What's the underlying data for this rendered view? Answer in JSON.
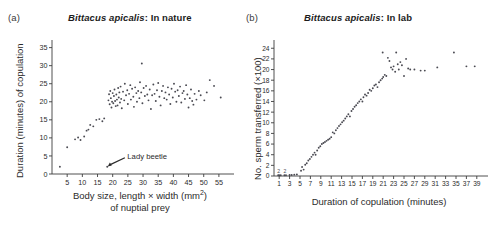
{
  "figure": {
    "background": "#ffffff",
    "point_color": "#4a4a52",
    "axis_color": "#3c3c3c"
  },
  "panels": [
    {
      "key": "a",
      "label": "(a)",
      "title_species": "Bittacus apicalis",
      "title_rest": ": In nature",
      "annotation": "Lady beetle",
      "chart_data": {
        "type": "scatter",
        "title": "Bittacus apicalis: In nature",
        "xlabel": "Body size, length × width (mm2) of nuptial prey",
        "ylabel": "Duration (minutes) of copulation",
        "xlim": [
          0,
          58
        ],
        "ylim": [
          0,
          36
        ],
        "xticks": [
          5,
          10,
          15,
          20,
          25,
          30,
          35,
          40,
          45,
          50,
          55
        ],
        "yticks": [
          0,
          5,
          10,
          15,
          20,
          25,
          30,
          35
        ],
        "grid": false,
        "legend": "none",
        "annotations": [
          {
            "text": "Lady beetle",
            "x": 18.2,
            "y": 2.0,
            "label_x": 24.5,
            "label_y": 5.2
          }
        ],
        "points": [
          [
            2.6,
            2.0
          ],
          [
            5.0,
            7.4
          ],
          [
            7.6,
            9.6
          ],
          [
            8.6,
            10.1
          ],
          [
            9.4,
            9.4
          ],
          [
            10.6,
            10.4
          ],
          [
            11.4,
            12.0
          ],
          [
            12.0,
            12.3
          ],
          [
            12.6,
            13.6
          ],
          [
            13.6,
            13.2
          ],
          [
            14.6,
            15.0
          ],
          [
            15.6,
            15.2
          ],
          [
            16.6,
            14.6
          ],
          [
            17.2,
            15.4
          ],
          [
            18.2,
            2.0
          ],
          [
            18.6,
            20.4
          ],
          [
            18.8,
            22.1
          ],
          [
            19.0,
            19.3
          ],
          [
            19.2,
            23.0
          ],
          [
            19.4,
            21.0
          ],
          [
            19.6,
            18.4
          ],
          [
            19.8,
            20.0
          ],
          [
            20.0,
            22.4
          ],
          [
            20.2,
            19.6
          ],
          [
            20.4,
            21.6
          ],
          [
            20.6,
            23.4
          ],
          [
            20.8,
            20.2
          ],
          [
            21.0,
            18.8
          ],
          [
            21.2,
            22.0
          ],
          [
            21.4,
            20.6
          ],
          [
            21.6,
            19.0
          ],
          [
            21.8,
            23.8
          ],
          [
            22.0,
            21.2
          ],
          [
            22.2,
            22.6
          ],
          [
            22.4,
            19.8
          ],
          [
            22.6,
            24.2
          ],
          [
            22.8,
            20.8
          ],
          [
            23.0,
            18.2
          ],
          [
            23.4,
            22.8
          ],
          [
            23.8,
            20.4
          ],
          [
            24.0,
            25.0
          ],
          [
            24.4,
            21.8
          ],
          [
            24.8,
            23.2
          ],
          [
            25.0,
            19.4
          ],
          [
            25.4,
            22.2
          ],
          [
            25.8,
            24.6
          ],
          [
            26.0,
            20.6
          ],
          [
            26.4,
            23.6
          ],
          [
            26.8,
            21.4
          ],
          [
            27.0,
            18.6
          ],
          [
            27.4,
            24.0
          ],
          [
            27.8,
            22.4
          ],
          [
            28.0,
            20.0
          ],
          [
            28.4,
            23.0
          ],
          [
            28.8,
            21.0
          ],
          [
            29.0,
            25.4
          ],
          [
            29.4,
            22.6
          ],
          [
            29.6,
            30.6
          ],
          [
            29.8,
            19.6
          ],
          [
            30.2,
            23.8
          ],
          [
            30.6,
            21.6
          ],
          [
            31.0,
            24.4
          ],
          [
            31.4,
            22.0
          ],
          [
            31.8,
            20.4
          ],
          [
            32.2,
            23.4
          ],
          [
            32.6,
            18.0
          ],
          [
            33.0,
            21.8
          ],
          [
            33.4,
            24.8
          ],
          [
            33.8,
            22.2
          ],
          [
            34.2,
            20.2
          ],
          [
            34.6,
            23.2
          ],
          [
            35.0,
            25.2
          ],
          [
            35.4,
            21.4
          ],
          [
            35.8,
            19.0
          ],
          [
            36.2,
            23.0
          ],
          [
            36.6,
            24.4
          ],
          [
            37.0,
            21.0
          ],
          [
            37.4,
            22.6
          ],
          [
            37.8,
            20.6
          ],
          [
            38.2,
            24.0
          ],
          [
            38.6,
            22.0
          ],
          [
            39.0,
            19.4
          ],
          [
            39.4,
            23.6
          ],
          [
            39.8,
            21.2
          ],
          [
            40.2,
            25.0
          ],
          [
            40.6,
            22.8
          ],
          [
            41.0,
            20.0
          ],
          [
            41.4,
            23.2
          ],
          [
            41.8,
            21.6
          ],
          [
            42.2,
            24.2
          ],
          [
            42.6,
            19.8
          ],
          [
            43.0,
            22.4
          ],
          [
            43.4,
            23.0
          ],
          [
            43.8,
            20.8
          ],
          [
            44.2,
            24.6
          ],
          [
            44.6,
            22.0
          ],
          [
            45.0,
            18.4
          ],
          [
            45.4,
            21.0
          ],
          [
            45.8,
            23.4
          ],
          [
            46.2,
            20.2
          ],
          [
            46.6,
            19.2
          ],
          [
            47.0,
            22.2
          ],
          [
            47.6,
            20.6
          ],
          [
            48.4,
            23.0
          ],
          [
            49.0,
            21.8
          ],
          [
            50.2,
            20.4
          ],
          [
            51.0,
            22.6
          ],
          [
            52.0,
            26.0
          ],
          [
            53.4,
            24.4
          ],
          [
            55.6,
            21.2
          ]
        ]
      }
    },
    {
      "key": "b",
      "label": "(b)",
      "title_species": "Bittacus apicalis",
      "title_rest": ": In lab",
      "annotation": null,
      "chart_data": {
        "type": "scatter",
        "title": "Bittacus apicalis: In lab",
        "xlabel": "Duration of copulation (minutes)",
        "ylabel": "No. sperm transferred (×100)",
        "xlim": [
          0,
          40
        ],
        "ylim": [
          0,
          24.8
        ],
        "xticks": [
          1,
          3,
          5,
          7,
          9,
          11,
          13,
          15,
          17,
          19,
          21,
          23,
          25,
          27,
          29,
          31,
          33,
          35,
          37,
          39
        ],
        "yticks": [
          0,
          2,
          4,
          6,
          8,
          10,
          12,
          14,
          16,
          18,
          20,
          22,
          24
        ],
        "grid": false,
        "legend": "none",
        "point_labels": [
          {
            "text": "2",
            "x": 0.9,
            "y": 0.55
          },
          {
            "text": "2",
            "x": 2.1,
            "y": 0.55
          }
        ],
        "points": [
          [
            0.8,
            0.15
          ],
          [
            1.0,
            0.15
          ],
          [
            1.3,
            0.15
          ],
          [
            2.0,
            0.15
          ],
          [
            2.3,
            0.15
          ],
          [
            3.0,
            0.2
          ],
          [
            3.4,
            0.2
          ],
          [
            3.9,
            0.25
          ],
          [
            4.4,
            0.3
          ],
          [
            5.2,
            1.0
          ],
          [
            5.4,
            1.7
          ],
          [
            5.7,
            1.2
          ],
          [
            6.0,
            2.1
          ],
          [
            6.3,
            2.4
          ],
          [
            6.6,
            2.9
          ],
          [
            6.9,
            3.2
          ],
          [
            7.2,
            3.6
          ],
          [
            7.5,
            4.0
          ],
          [
            7.8,
            4.4
          ],
          [
            8.0,
            4.0
          ],
          [
            8.3,
            4.8
          ],
          [
            8.6,
            5.3
          ],
          [
            8.9,
            5.6
          ],
          [
            9.2,
            6.0
          ],
          [
            9.5,
            6.2
          ],
          [
            9.8,
            6.4
          ],
          [
            10.1,
            6.6
          ],
          [
            10.4,
            6.8
          ],
          [
            10.7,
            7.0
          ],
          [
            11.0,
            7.3
          ],
          [
            11.3,
            8.2
          ],
          [
            11.6,
            8.0
          ],
          [
            11.9,
            8.6
          ],
          [
            12.2,
            9.0
          ],
          [
            12.5,
            9.4
          ],
          [
            12.8,
            9.7
          ],
          [
            13.1,
            10.1
          ],
          [
            13.4,
            10.4
          ],
          [
            13.7,
            10.8
          ],
          [
            14.0,
            11.2
          ],
          [
            14.3,
            11.6
          ],
          [
            14.6,
            11.2
          ],
          [
            14.9,
            12.2
          ],
          [
            15.2,
            12.6
          ],
          [
            15.5,
            13.0
          ],
          [
            15.8,
            13.3
          ],
          [
            16.1,
            13.7
          ],
          [
            16.4,
            14.0
          ],
          [
            16.7,
            14.4
          ],
          [
            17.0,
            14.0
          ],
          [
            17.2,
            14.8
          ],
          [
            17.5,
            15.3
          ],
          [
            17.8,
            15.1
          ],
          [
            18.1,
            15.6
          ],
          [
            18.4,
            16.2
          ],
          [
            18.7,
            16.0
          ],
          [
            19.0,
            16.5
          ],
          [
            19.3,
            17.0
          ],
          [
            19.6,
            17.2
          ],
          [
            19.9,
            16.7
          ],
          [
            20.2,
            17.6
          ],
          [
            20.5,
            18.0
          ],
          [
            20.8,
            18.3
          ],
          [
            21.0,
            18.6
          ],
          [
            21.3,
            19.0
          ],
          [
            21.6,
            18.8
          ],
          [
            21.9,
            22.2
          ],
          [
            20.9,
            23.2
          ],
          [
            22.2,
            21.6
          ],
          [
            22.5,
            20.4
          ],
          [
            22.8,
            20.0
          ],
          [
            23.0,
            20.6
          ],
          [
            23.3,
            19.6
          ],
          [
            23.5,
            23.2
          ],
          [
            23.8,
            21.0
          ],
          [
            24.0,
            20.0
          ],
          [
            24.3,
            21.4
          ],
          [
            24.6,
            20.8
          ],
          [
            25.0,
            18.8
          ],
          [
            25.4,
            22.0
          ],
          [
            25.8,
            20.2
          ],
          [
            26.2,
            20.0
          ],
          [
            27.0,
            20.0
          ],
          [
            28.2,
            19.8
          ],
          [
            29.0,
            19.8
          ],
          [
            31.4,
            20.4
          ],
          [
            34.6,
            23.2
          ],
          [
            37.0,
            20.6
          ],
          [
            38.6,
            20.6
          ]
        ]
      }
    }
  ]
}
